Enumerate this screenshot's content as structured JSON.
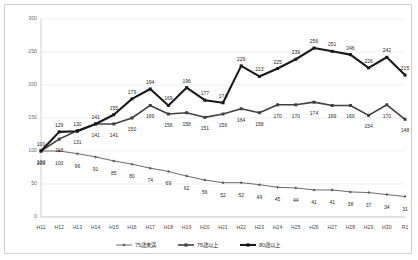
{
  "chart_data": {
    "type": "line",
    "title": "",
    "subtitle": "",
    "xlabel": "",
    "ylabel": "",
    "ylim": [
      0,
      300
    ],
    "ytick_values": [
      0,
      50,
      100,
      150,
      200,
      250,
      300
    ],
    "ytick_labels": [
      "0",
      "50",
      "100",
      "150",
      "200",
      "250",
      "300"
    ],
    "grid": true,
    "legend_position": "bottom",
    "data_labels": true,
    "categories": [
      "H11",
      "H12",
      "H13",
      "H14",
      "H15",
      "H16",
      "H17",
      "H18",
      "H19",
      "H20",
      "H21",
      "H22",
      "H23",
      "H24",
      "H25",
      "H26",
      "H27",
      "H28",
      "H29",
      "H30",
      "R1"
    ],
    "series": [
      {
        "name": "75歳未満",
        "color": "#595959",
        "marker": "diamond",
        "width": 0.9,
        "values": [
          100,
          100,
          96,
          91,
          85,
          80,
          74,
          69,
          62,
          56,
          52,
          52,
          49,
          45,
          44,
          41,
          41,
          38,
          37,
          34,
          31
        ]
      },
      {
        "name": "75歳以上",
        "color": "#404040",
        "marker": "square",
        "width": 1.6,
        "values": [
          100,
          118,
          131,
          141,
          141,
          150,
          169,
          156,
          158,
          151,
          156,
          164,
          158,
          170,
          170,
          174,
          169,
          169,
          154,
          170,
          148
        ]
      },
      {
        "name": "80歳以上",
        "color": "#1a1a1a",
        "marker": "square",
        "width": 2.1,
        "values": [
          100,
          129,
          130,
          141,
          155,
          179,
          194,
          169,
          196,
          177,
          173,
          229,
          213,
          225,
          239,
          256,
          251,
          246,
          226,
          242,
          215
        ]
      }
    ]
  },
  "legend": {
    "items": [
      {
        "label": "75歳未満"
      },
      {
        "label": "75歳以上"
      },
      {
        "label": "80歳以上"
      }
    ]
  },
  "colors": {
    "frame_border": "#d0d0d0",
    "gridline": "#e3e3e3",
    "background": "#ffffff"
  }
}
